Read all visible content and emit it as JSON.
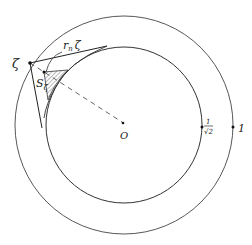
{
  "diagram": {
    "center": {
      "label": "O",
      "x": 124,
      "y": 125
    },
    "outer_circle": {
      "r": 109,
      "label": "1",
      "label_point": {
        "x": 233,
        "y": 128
      }
    },
    "inner_circle": {
      "r": 78,
      "label": "1/√2",
      "label_num": "1",
      "label_den": "√2",
      "label_point": {
        "x": 202,
        "y": 128
      }
    },
    "point_zeta": {
      "label": "ζ",
      "x": 30,
      "y": 63
    },
    "point_s_zeta": {
      "label": "S",
      "subscript": "ζ",
      "x": 44,
      "y": 72
    },
    "curve_label": {
      "text": "r",
      "subscript": "n",
      "suffix": "ζ"
    },
    "tangent_points": [
      {
        "x": 107,
        "y": 46
      },
      {
        "x": 42,
        "y": 128
      }
    ],
    "colors": {
      "stroke": "#333333",
      "hatch": "#555555"
    }
  }
}
